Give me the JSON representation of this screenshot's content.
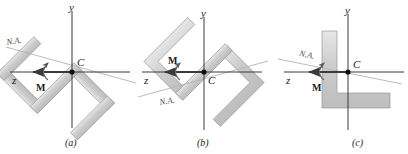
{
  "figure": {
    "type": "engineering-diagram",
    "topic": "Unsymmetric bending: neutral axis orientation for three cross sections",
    "colors": {
      "section_fill": "#c9c9c9",
      "section_fill_light": "#e2e2e2",
      "section_stroke": "#9a9a9a",
      "axis": "#3a3a3a",
      "na_line": "#b0b0b0",
      "text": "#1b1b1b",
      "background": "#ffffff"
    }
  },
  "panels": [
    {
      "id": "a",
      "caption": "(a)",
      "section_name": "z-section-rotated",
      "axes": {
        "y_label": "y",
        "z_label": "z"
      },
      "centroid_label": "C",
      "moment_label": "M",
      "neutral_axis_label": "N.A.",
      "na_angle_deg": -12,
      "section_rotation_deg": -45
    },
    {
      "id": "b",
      "caption": "(b)",
      "section_name": "z-angle-section-rotated",
      "axes": {
        "y_label": "y",
        "z_label": "z"
      },
      "centroid_label": "C",
      "moment_label": "M",
      "neutral_axis_label": "N.A.",
      "na_angle_deg": 12,
      "section_rotation_deg": -45
    },
    {
      "id": "c",
      "caption": "(c)",
      "section_name": "l-angle-section-upright",
      "axes": {
        "y_label": "y",
        "z_label": "z"
      },
      "centroid_label": "C",
      "moment_label": "M",
      "neutral_axis_label": "N.A.",
      "na_angle_deg": -11,
      "section_rotation_deg": 0
    }
  ]
}
